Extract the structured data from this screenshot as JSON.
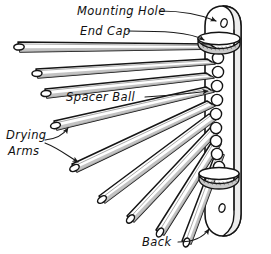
{
  "diagram": {
    "title": "Wall-Mounted Drying Rack Exploded Parts Diagram",
    "background_color": "#ffffff",
    "ink_color": "#1a1a1a",
    "shade_color": "#b9b9b9",
    "width": 271,
    "height": 254,
    "style": "hand-drawn technical line illustration"
  },
  "labels": {
    "mounting_hole": "Mounting Hole",
    "end_cap": "End Cap",
    "spacer_ball": "Spacer Ball",
    "drying_arms_line1": "Drying",
    "drying_arms_line2": "Arms",
    "back": "Back"
  },
  "parts": {
    "arms": {
      "name": "Drying Arms",
      "count": 9,
      "description": "round wooden dowels fanning out from a pivot on the back board"
    },
    "spacer_balls": {
      "name": "Spacer Ball",
      "count": 9,
      "description": "round beads stacked between arm pivot ends"
    },
    "end_caps": {
      "name": "End Cap",
      "count": 2,
      "description": "elliptical discs capping the top and bottom of the pivot stack"
    },
    "mounting_holes": {
      "name": "Mounting Hole",
      "count": 2,
      "description": "screw holes near the top and bottom of the back board"
    },
    "back": {
      "name": "Back",
      "count": 1,
      "description": "vertical wall-mount board with rounded top and bottom"
    }
  }
}
